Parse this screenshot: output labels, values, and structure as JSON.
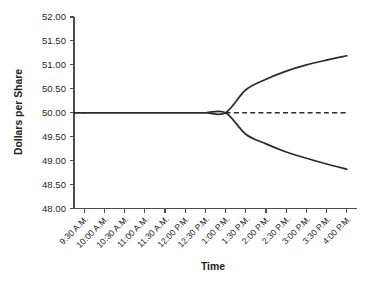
{
  "chart_data": {
    "type": "line",
    "title": "",
    "xlabel": "Time",
    "ylabel": "Dollars per Share",
    "grid": false,
    "legend": "none",
    "ylim": [
      48.0,
      52.0
    ],
    "ytick_labels": [
      "52.00",
      "51.50",
      "51.00",
      "50.50",
      "50.00",
      "49.50",
      "49.00",
      "48.50",
      "48.00"
    ],
    "ytick_values": [
      52.0,
      51.5,
      51.0,
      50.5,
      50.0,
      49.5,
      49.0,
      48.5,
      48.0
    ],
    "categories": [
      "9:30 A.M.",
      "10:00 A.M.",
      "10:30 A.M.",
      "11:00 A.M.",
      "11:30 A.M.",
      "12:00 P.M.",
      "12:30 P.M.",
      "1:00 P.M.",
      "1:30 P.M.",
      "2:00 P.M.",
      "2:30 P.M.",
      "3:00 P.M.",
      "3:30 P.M.",
      "4:00 P.M."
    ],
    "series": [
      {
        "name": "upper-branch",
        "style": "solid",
        "x": [
          "9:30 A.M.",
          "10:00 A.M.",
          "10:30 A.M.",
          "11:00 A.M.",
          "11:30 A.M.",
          "12:00 P.M.",
          "12:30 P.M.",
          "1:00 P.M.",
          "1:30 P.M.",
          "2:00 P.M.",
          "2:30 P.M.",
          "3:00 P.M.",
          "3:30 P.M.",
          "4:00 P.M."
        ],
        "values": [
          50.0,
          50.0,
          50.0,
          50.0,
          50.0,
          50.0,
          50.0,
          50.0,
          50.48,
          50.7,
          50.87,
          51.0,
          51.1,
          51.19
        ]
      },
      {
        "name": "lower-branch",
        "style": "solid",
        "x": [
          "9:30 A.M.",
          "10:00 A.M.",
          "10:30 A.M.",
          "11:00 A.M.",
          "11:30 A.M.",
          "12:00 P.M.",
          "12:30 P.M.",
          "1:00 P.M.",
          "1:30 P.M.",
          "2:00 P.M.",
          "2:30 P.M.",
          "3:00 P.M.",
          "3:30 P.M.",
          "4:00 P.M."
        ],
        "values": [
          50.0,
          50.0,
          50.0,
          50.0,
          50.0,
          50.0,
          50.0,
          50.0,
          49.55,
          49.35,
          49.18,
          49.05,
          48.93,
          48.82
        ]
      },
      {
        "name": "reference-flat",
        "style": "dashed",
        "x": [
          "1:00 P.M.",
          "1:30 P.M.",
          "2:00 P.M.",
          "2:30 P.M.",
          "3:00 P.M.",
          "3:30 P.M.",
          "4:00 P.M."
        ],
        "values": [
          50.0,
          50.0,
          50.0,
          50.0,
          50.0,
          50.0,
          50.0
        ]
      }
    ],
    "colors": {
      "line": "#2b2b2b",
      "axis": "#4d4d4f",
      "text": "#231f20",
      "background": "#ffffff"
    }
  }
}
